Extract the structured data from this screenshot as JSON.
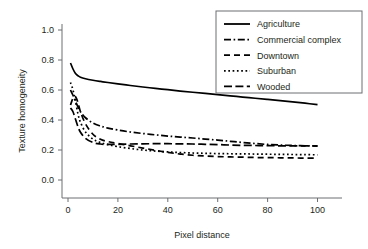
{
  "chart_data": {
    "type": "line",
    "title": "",
    "xlabel": "Pixel distance",
    "ylabel": "Texture homogeneity",
    "xlim": [
      0,
      105
    ],
    "ylim": [
      0.0,
      1.05
    ],
    "xticks": [
      0,
      20,
      40,
      60,
      80,
      100
    ],
    "xtick_labels": [
      "0",
      "20",
      "40",
      "60",
      "80",
      "100"
    ],
    "yticks": [
      0.0,
      0.2,
      0.4,
      0.6,
      0.8,
      1.0
    ],
    "ytick_labels": [
      "0.0",
      "0.2",
      "0.4",
      "0.6",
      "0.8",
      "1.0"
    ],
    "grid": false,
    "legend_position": "top-right",
    "x": [
      1,
      2,
      3,
      4,
      5,
      7,
      10,
      13,
      16,
      20,
      25,
      30,
      35,
      40,
      45,
      50,
      55,
      60,
      65,
      70,
      75,
      80,
      85,
      90,
      95,
      100
    ],
    "series": [
      {
        "name": "Agriculture",
        "linestyle": "solid",
        "values": [
          0.78,
          0.74,
          0.71,
          0.695,
          0.685,
          0.675,
          0.665,
          0.657,
          0.65,
          0.641,
          0.63,
          0.62,
          0.611,
          0.602,
          0.593,
          0.585,
          0.577,
          0.569,
          0.561,
          0.553,
          0.545,
          0.537,
          0.529,
          0.521,
          0.512,
          0.502
        ]
      },
      {
        "name": "Commercial complex",
        "linestyle": "dashdot",
        "values": [
          0.6,
          0.565,
          0.525,
          0.487,
          0.455,
          0.415,
          0.38,
          0.36,
          0.346,
          0.333,
          0.32,
          0.31,
          0.301,
          0.293,
          0.286,
          0.28,
          0.273,
          0.266,
          0.258,
          0.25,
          0.243,
          0.237,
          0.233,
          0.23,
          0.228,
          0.226
        ]
      },
      {
        "name": "Downtown",
        "linestyle": "dashed",
        "values": [
          0.5,
          0.545,
          0.555,
          0.515,
          0.455,
          0.375,
          0.305,
          0.272,
          0.256,
          0.243,
          0.228,
          0.213,
          0.198,
          0.184,
          0.173,
          0.165,
          0.16,
          0.156,
          0.154,
          0.152,
          0.15,
          0.149,
          0.148,
          0.147,
          0.146,
          0.145
        ]
      },
      {
        "name": "Suburban",
        "linestyle": "dotted",
        "values": [
          0.65,
          0.6,
          0.525,
          0.44,
          0.385,
          0.32,
          0.272,
          0.25,
          0.236,
          0.222,
          0.21,
          0.2,
          0.193,
          0.187,
          0.183,
          0.18,
          0.178,
          0.176,
          0.175,
          0.174,
          0.173,
          0.172,
          0.171,
          0.17,
          0.169,
          0.168
        ]
      },
      {
        "name": "Wooded",
        "linestyle": "longdash",
        "values": [
          0.48,
          0.455,
          0.405,
          0.355,
          0.318,
          0.278,
          0.25,
          0.24,
          0.237,
          0.238,
          0.24,
          0.241,
          0.242,
          0.242,
          0.241,
          0.24,
          0.238,
          0.236,
          0.233,
          0.231,
          0.23,
          0.229,
          0.228,
          0.228,
          0.228,
          0.227
        ]
      }
    ]
  },
  "legend": {
    "entries": [
      {
        "label": "Agriculture",
        "linestyle": "solid"
      },
      {
        "label": "Commercial complex",
        "linestyle": "dashdot"
      },
      {
        "label": "Downtown",
        "linestyle": "dashed"
      },
      {
        "label": "Suburban",
        "linestyle": "dotted"
      },
      {
        "label": "Wooded",
        "linestyle": "longdash"
      }
    ]
  },
  "colors": {
    "line": "#000000",
    "axis": "#6d6e71",
    "text": "#231f20",
    "background": "#ffffff"
  }
}
